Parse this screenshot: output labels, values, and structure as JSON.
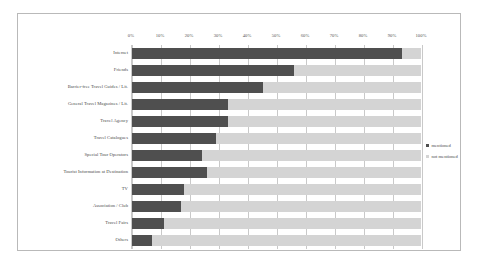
{
  "chart_data": {
    "type": "bar",
    "orientation": "horizontal",
    "stacked": true,
    "title": "",
    "subtitle": "",
    "xlabel": "",
    "ylabel": "",
    "xlim": [
      0,
      100
    ],
    "grid": true,
    "legend_position": "right",
    "categories": [
      "Internet",
      "Friends",
      "Barrier-free Travel Guides / Lit.",
      "General Travel Magazines / Lit.",
      "Travel Agency",
      "Travel Catalogues",
      "Special Tour Operators",
      "Tourist Information at Destination",
      "TV",
      "Association / Club",
      "Travel Fairs",
      "Others"
    ],
    "tick_labels": [
      "0%",
      "10%",
      "20%",
      "30%",
      "40%",
      "50%",
      "60%",
      "70%",
      "80%",
      "90%",
      "100%"
    ],
    "tick_values": [
      0,
      10,
      20,
      30,
      40,
      50,
      60,
      70,
      80,
      90,
      100
    ],
    "series": [
      {
        "name": "mentioned",
        "color": "#4f4f4f",
        "values": [
          93,
          56,
          45,
          33,
          33,
          29,
          24,
          26,
          18,
          17,
          11,
          7
        ]
      },
      {
        "name": "not mentioned",
        "color": "#d4d4d4",
        "values": [
          7,
          44,
          55,
          67,
          67,
          71,
          76,
          74,
          82,
          83,
          89,
          93
        ]
      }
    ]
  },
  "legend": {
    "items": [
      {
        "label": "mentioned",
        "color": "#4f4f4f"
      },
      {
        "label": "not mentioned",
        "color": "#d4d4d4"
      }
    ]
  },
  "colors": {
    "mentioned": "#4f4f4f",
    "not_mentioned": "#d4d4d4",
    "gridline": "#c9c9c9",
    "frame": "#b9b9b9",
    "text": "#4a4a4a",
    "background": "#ffffff"
  }
}
